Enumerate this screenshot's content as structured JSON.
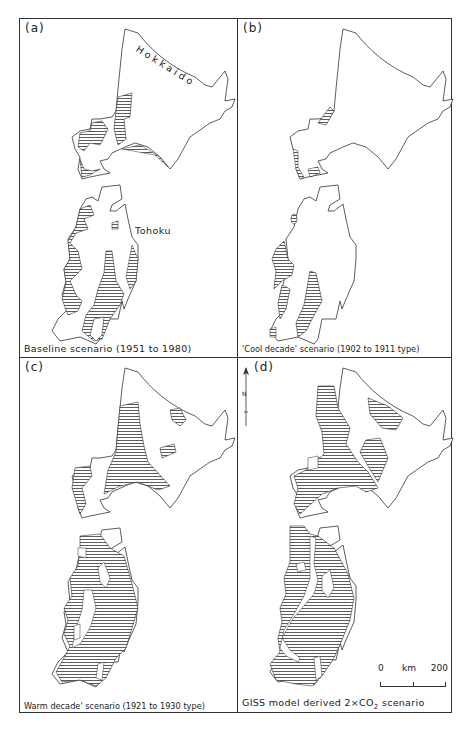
{
  "figure": {
    "panels": [
      {
        "id": "a",
        "label": "(a)",
        "caption": "Baseline scenario (1951 to 1980)",
        "places": {
          "hokkaido": "Hokkaido",
          "tohoku": "Tohoku"
        }
      },
      {
        "id": "b",
        "label": "(b)",
        "caption": "'Cool decade' scenario (1902 to 1911 type)"
      },
      {
        "id": "c",
        "label": "(c)",
        "caption": "Warm decade' scenario (1921 to 1930 type)"
      },
      {
        "id": "d",
        "label": "(d)",
        "caption_pre": "GISS model derived 2×CO",
        "caption_sub": "2",
        "caption_post": " scenario"
      }
    ],
    "north_arrow": {
      "label": "N"
    },
    "scale_bar": {
      "start": "0",
      "unit": "km",
      "end": "200"
    },
    "hatch_color": "#333333",
    "line_color": "#333333"
  }
}
